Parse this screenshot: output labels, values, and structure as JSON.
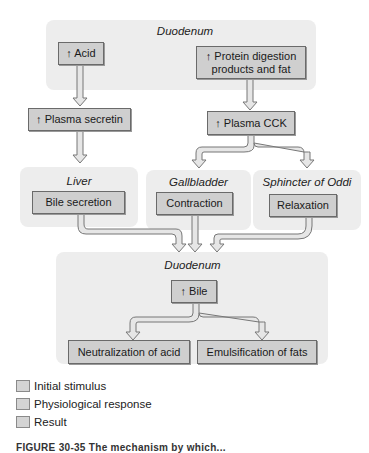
{
  "regions": {
    "duodenum_top": "Duodenum",
    "liver": "Liver",
    "gallbladder": "Gallbladder",
    "sphincter": "Sphincter of Oddi",
    "duodenum_bottom": "Duodenum"
  },
  "boxes": {
    "acid": "↑ Acid",
    "protein": "↑ Protein digestion products and fat",
    "secretin": "↑ Plasma secretin",
    "cck": "↑ Plasma CCK",
    "bile_secretion": "Bile secretion",
    "contraction": "Contraction",
    "relaxation": "Relaxation",
    "bile": "↑ Bile",
    "neutralization": "Neutralization of acid",
    "emulsification": "Emulsification of fats"
  },
  "legend": [
    {
      "label": "Initial stimulus"
    },
    {
      "label": "Physiological response"
    },
    {
      "label": "Result"
    }
  ],
  "caption": "FIGURE 30-35 The mechanism by which..."
}
